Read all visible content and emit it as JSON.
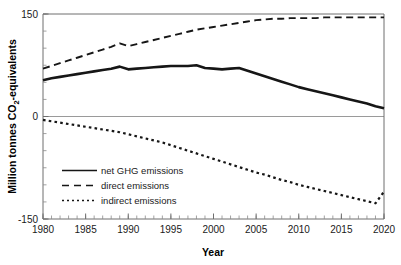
{
  "chart_data": {
    "type": "line",
    "title": "",
    "xlabel": "Year",
    "ylabel": "Million tonnes CO2-equivalents",
    "ylabel_parts": {
      "prefix": "Million tonnes CO",
      "subscript": "2",
      "suffix": "-equivalents"
    },
    "xlim": [
      1980,
      2020
    ],
    "ylim": [
      -150,
      150
    ],
    "grid": false,
    "zero_line": true,
    "legend_position": "lower-left-inside",
    "x_tick_labels": [
      "1980",
      "1985",
      "1990",
      "1995",
      "2000",
      "2005",
      "2010",
      "2015",
      "2020"
    ],
    "x_ticks": [
      1980,
      1985,
      1990,
      1995,
      2000,
      2005,
      2010,
      2015,
      2020
    ],
    "x_minor_tick_step": 1,
    "y_tick_labels": [
      "150",
      "0",
      "-150"
    ],
    "y_ticks": [
      150,
      0,
      -150
    ],
    "y_minor_tick_step": 25,
    "x": [
      1980,
      1981,
      1982,
      1983,
      1984,
      1985,
      1986,
      1987,
      1988,
      1989,
      1990,
      1991,
      1992,
      1993,
      1994,
      1995,
      1996,
      1997,
      1998,
      1999,
      2000,
      2001,
      2002,
      2003,
      2004,
      2005,
      2006,
      2007,
      2008,
      2009,
      2010,
      2011,
      2012,
      2013,
      2014,
      2015,
      2016,
      2017,
      2018,
      2019,
      2020
    ],
    "series": [
      {
        "name": "net GHG emissions",
        "style": "solid",
        "values": [
          53,
          56,
          58,
          60,
          62,
          64,
          66,
          68,
          70,
          73,
          69,
          70,
          71,
          72,
          73,
          74,
          74,
          74,
          75,
          71,
          70,
          69,
          70,
          71,
          67,
          63,
          59,
          55,
          51,
          47,
          43,
          40,
          37,
          34,
          31,
          28,
          25,
          22,
          19,
          15,
          12
        ]
      },
      {
        "name": "direct emissions",
        "style": "dashed",
        "values": [
          70,
          74,
          78,
          82,
          86,
          90,
          94,
          98,
          102,
          107,
          103,
          106,
          109,
          112,
          115,
          118,
          121,
          124,
          127,
          129,
          131,
          133,
          135,
          137,
          139,
          141,
          142,
          143,
          143,
          144,
          144,
          144,
          144,
          145,
          145,
          145,
          145,
          145,
          145,
          145,
          145
        ]
      },
      {
        "name": "indirect emissions",
        "style": "dotted",
        "values": [
          -5,
          -7,
          -9,
          -11,
          -13,
          -15,
          -17,
          -19,
          -21,
          -23,
          -26,
          -29,
          -32,
          -35,
          -38,
          -42,
          -46,
          -50,
          -54,
          -58,
          -62,
          -66,
          -70,
          -74,
          -78,
          -82,
          -85,
          -89,
          -93,
          -96,
          -100,
          -103,
          -106,
          -109,
          -112,
          -115,
          -118,
          -121,
          -124,
          -127,
          -110
        ]
      }
    ],
    "legend_entries": [
      {
        "label": "net GHG emissions",
        "style": "solid"
      },
      {
        "label": "direct emissions",
        "style": "dashed"
      },
      {
        "label": "indirect emissions",
        "style": "dotted"
      }
    ]
  }
}
